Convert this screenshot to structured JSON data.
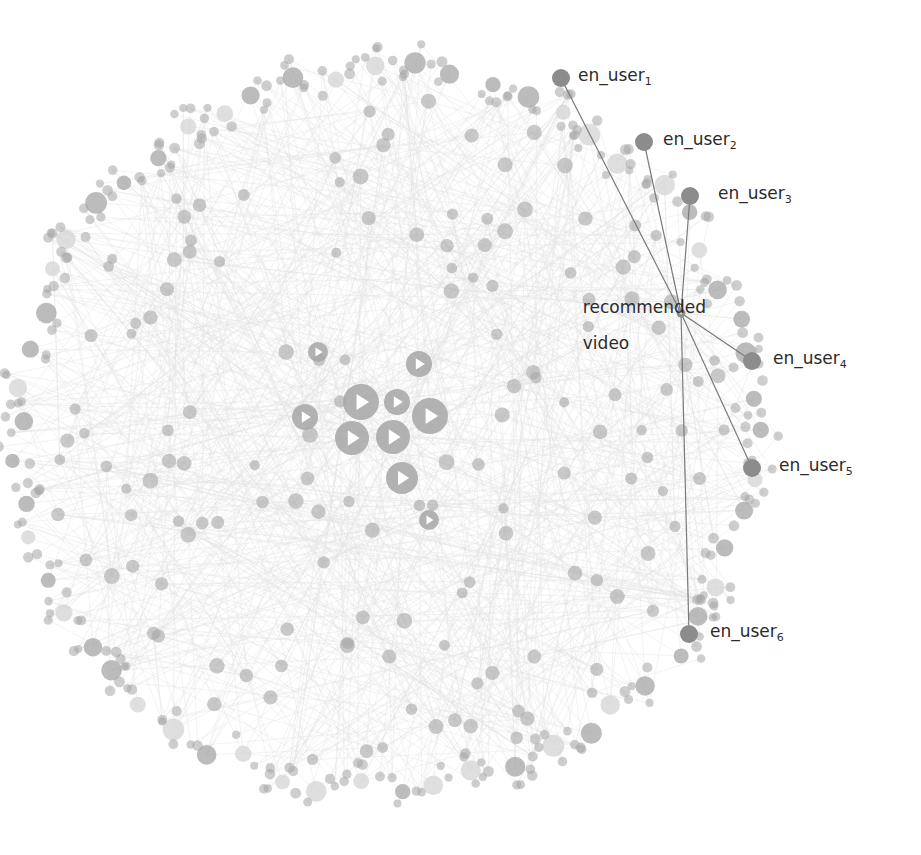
{
  "figure": {
    "type": "network-graph",
    "center": [
      385,
      430
    ],
    "ring_radius": 360,
    "colors": {
      "background": "#ffffff",
      "node": "#a6a6a6",
      "node_light": "#d4d4d4",
      "node_highlight": "#8c8c8c",
      "edge_faint": "#e4e4e4",
      "edge_highlight": "#7a7a7a",
      "play_icon": "#ffffff",
      "label_text": "#2b2b2b"
    }
  },
  "recommended_video": {
    "label_line1": "recommended",
    "label_line2": "video",
    "x": 681,
    "y": 313,
    "label_x": 572,
    "label_y": 280
  },
  "users": [
    {
      "base": "en_user",
      "sub": "1",
      "x": 561,
      "y": 78,
      "label_x": 578,
      "label_y": 67
    },
    {
      "base": "en_user",
      "sub": "2",
      "x": 644,
      "y": 142,
      "label_x": 663,
      "label_y": 131
    },
    {
      "base": "en_user",
      "sub": "3",
      "x": 690,
      "y": 196,
      "label_x": 718,
      "label_y": 185
    },
    {
      "base": "en_user",
      "sub": "4",
      "x": 752,
      "y": 361,
      "label_x": 773,
      "label_y": 350
    },
    {
      "base": "en_user",
      "sub": "5",
      "x": 752,
      "y": 468,
      "label_x": 779,
      "label_y": 457
    },
    {
      "base": "en_user",
      "sub": "6",
      "x": 689,
      "y": 634,
      "label_x": 710,
      "label_y": 623
    }
  ],
  "video_hubs": [
    {
      "x": 361,
      "y": 402,
      "r": 18
    },
    {
      "x": 397,
      "y": 402,
      "r": 13
    },
    {
      "x": 430,
      "y": 416,
      "r": 18
    },
    {
      "x": 305,
      "y": 417,
      "r": 13
    },
    {
      "x": 352,
      "y": 438,
      "r": 17
    },
    {
      "x": 393,
      "y": 437,
      "r": 17
    },
    {
      "x": 402,
      "y": 478,
      "r": 16
    },
    {
      "x": 419,
      "y": 364,
      "r": 13
    },
    {
      "x": 318,
      "y": 352,
      "r": 10
    },
    {
      "x": 429,
      "y": 520,
      "r": 10
    }
  ],
  "layout": {
    "seed": 7,
    "ring_clusters": 58,
    "inner_nodes": 150,
    "faint_edges": 900
  }
}
